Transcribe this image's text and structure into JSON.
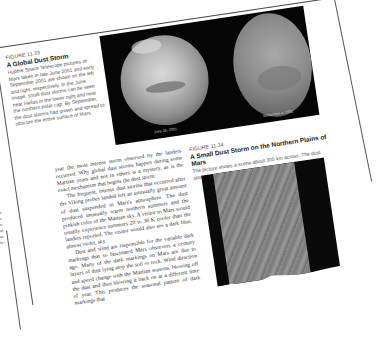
{
  "figure_11_33": {
    "label": "FIGURE 11.33",
    "title": "A Global Dust Storm",
    "caption": "Hubble Space Telescope pictures of Mars taken in late June 2001 and early September 2001 are shown on the left and right, respectively. In the June image, small dust storms can be seen near Hellas in the lower right and near the northern polar cap. By September, the dust storms had grown and spread to obscure the entire surface of Mars.",
    "image_dates": [
      "June 26, 2001",
      "September 4, 2001"
    ]
  },
  "body_text": {
    "paragraphs": [
      "year the most intense storm observed by the landers occurred. Why global dust storms happen during some Martian years and not in others is a mystery, as is the exact mechanism that begins the dust storm.",
      "The frequent, intense dust storms that occurred after the Viking probes landed left an unusually great amount of dust suspended in Mars's atmosphere. The dust produced unusually warm northern summers and the pinkish color of the Martian sky. A visitor to Mars would usually experience summers 20 to 30 K cooler than the landers reported. The visitor would also see a dark blue, almost violet, sky.",
      "Dust and wind are responsible for the variable dark markings that so fascinated Mars observers a century ago. Many of the dark markings on Mars are due to layers of dust lying atop the soil or rock. Wind direction and speed change with the Martian seasons, blowing off the dust and then blowing it back on at a different time of year. This produces the seasonal pattern of dark markings that"
    ]
  },
  "figure_11_34": {
    "label": "FIGURE 11.34",
    "title": "A Small Dust Storm on the Northern Plains of Mars",
    "caption": "The picture shows a scene about 300 km across. The dust storm is moving from top to bottom."
  },
  "left_fragment": {
    "lines": [
      "t",
      "s",
      "n",
      "al",
      "ar",
      "ic-"
    ]
  }
}
